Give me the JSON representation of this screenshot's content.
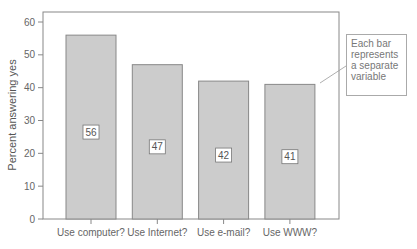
{
  "chart_data": {
    "type": "bar",
    "title": "",
    "xlabel": "",
    "ylabel": "Percent answering yes",
    "ylim": [
      0,
      60
    ],
    "yticks": [
      0,
      10,
      20,
      30,
      40,
      50,
      60
    ],
    "grid": false,
    "categories": [
      "Use computer?",
      "Use Internet?",
      "Use e-mail?",
      "Use WWW?"
    ],
    "values": [
      56,
      47,
      42,
      41
    ],
    "data_labels": [
      "56",
      "47",
      "42",
      "41"
    ],
    "bar_color": "#cccccc",
    "bar_edge_color": "#888888",
    "annotations": [
      {
        "text": "Each bar represents a separate variable",
        "points_to": "Use WWW?"
      }
    ]
  },
  "callout": {
    "line1": "Each bar",
    "line2": "represents",
    "line3": "a separate",
    "line4": "variable"
  }
}
